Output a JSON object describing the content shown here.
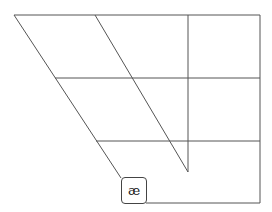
{
  "diagram": {
    "type": "ipa-vowel-trapezoid",
    "line_color": "#555555",
    "vowels": [
      {
        "symbol": "æ",
        "position": "near-open front unrounded",
        "x": 121,
        "y": 177,
        "w": 26,
        "h": 27
      }
    ]
  }
}
